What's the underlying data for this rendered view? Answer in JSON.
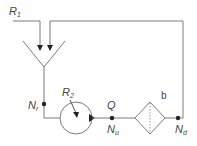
{
  "diagram": {
    "labels": {
      "r1": "R",
      "r1_sub": "1",
      "r2": "R",
      "r2_sub": "2",
      "nr": "N",
      "nr_sub": "r",
      "q": "Q",
      "nu": "N",
      "nu_sub": "u",
      "nd": "N",
      "nd_sub": "d",
      "b": "b"
    },
    "colors": {
      "line": "#7a7a7a",
      "dark": "#222222",
      "text": "#444444"
    }
  }
}
